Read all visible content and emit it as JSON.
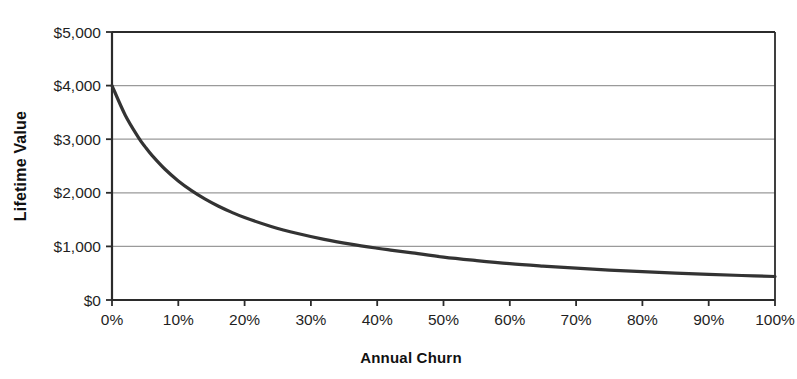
{
  "chart_data": {
    "type": "line",
    "title": "",
    "xlabel": "Annual Churn",
    "ylabel": "Lifetime Value",
    "xlim": [
      0,
      100
    ],
    "ylim": [
      0,
      5000
    ],
    "grid": true,
    "legend": false,
    "legend_position": "none",
    "line_color": "#333333",
    "axis_color": "#2b2b2b",
    "grid_color": "#9a9a9a",
    "x_tick_labels": [
      "0%",
      "10%",
      "20%",
      "30%",
      "40%",
      "50%",
      "60%",
      "70%",
      "80%",
      "90%",
      "100%"
    ],
    "x_tick_values": [
      0,
      10,
      20,
      30,
      40,
      50,
      60,
      70,
      80,
      90,
      100
    ],
    "y_tick_labels": [
      "$0",
      "$1,000",
      "$2,000",
      "$3,000",
      "$4,000",
      "$5,000"
    ],
    "y_tick_values": [
      0,
      1000,
      2000,
      3000,
      4000,
      5000
    ],
    "series": [
      {
        "name": "Lifetime Value",
        "x": [
          0,
          2,
          4,
          5,
          6,
          8,
          10,
          12,
          14,
          16,
          18,
          20,
          24,
          28,
          32,
          36,
          40,
          42,
          45,
          50,
          55,
          60,
          65,
          70,
          75,
          80,
          85,
          90,
          95,
          100
        ],
        "values": [
          4000,
          3448,
          3030,
          2857,
          2703,
          2439,
          2222,
          2041,
          1887,
          1754,
          1639,
          1538,
          1373,
          1240,
          1131,
          1042,
          966,
          932,
          885,
          800,
          735,
          678,
          633,
          593,
          559,
          529,
          502,
          478,
          457,
          438
        ]
      }
    ],
    "annotations": []
  }
}
